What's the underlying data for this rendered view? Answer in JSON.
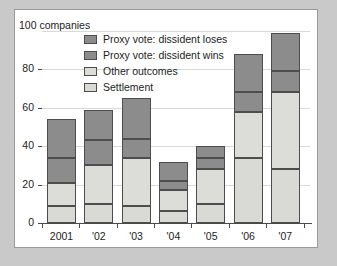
{
  "chart_data": {
    "type": "bar",
    "subtype": "stacked",
    "title": "",
    "xlabel": "",
    "ylabel": "100 companies",
    "units_label": "100 companies",
    "categories": [
      "2001",
      "'02",
      "'03",
      "'04",
      "'05",
      "'06",
      "'07"
    ],
    "ylim": [
      0,
      100
    ],
    "yticks": [
      0,
      20,
      40,
      60,
      80,
      100
    ],
    "ytick_labels": [
      "0",
      "20",
      "40",
      "60",
      "80",
      "100"
    ],
    "grid": true,
    "grid_axis": "y",
    "legend_position": "top-left-inside",
    "series": [
      {
        "name": "Settlement",
        "color": "#d9d9d6",
        "values": [
          9,
          10,
          9,
          6,
          10,
          34,
          28
        ]
      },
      {
        "name": "Other outcomes",
        "color": "#dcdcd9",
        "values": [
          12,
          20,
          25,
          11,
          18,
          24,
          40
        ]
      },
      {
        "name": "Proxy vote: dissident wins",
        "color": "#8c8c8c",
        "values": [
          13,
          13,
          10,
          5,
          6,
          10,
          11
        ]
      },
      {
        "name": "Proxy vote: dissident loses",
        "color": "#8c8c8c",
        "values": [
          20,
          16,
          21,
          10,
          6,
          20,
          20
        ]
      }
    ],
    "totals": [
      54,
      59,
      65,
      32,
      40,
      88,
      99
    ],
    "stack_boundaries": {
      "2001": [
        9,
        21,
        34,
        54
      ],
      "'02": [
        10,
        30,
        43,
        59
      ],
      "'03": [
        9,
        34,
        44,
        65
      ],
      "'04": [
        6,
        17,
        22,
        32
      ],
      "'05": [
        10,
        28,
        34,
        40
      ],
      "'06": [
        34,
        58,
        68,
        88
      ],
      "'07": [
        28,
        68,
        79,
        99
      ]
    }
  },
  "legend": {
    "items": [
      {
        "label": "Proxy vote: dissident loses",
        "color": "#8c8c8c"
      },
      {
        "label": "Proxy vote: dissident wins",
        "color": "#8c8c8c"
      },
      {
        "label": "Other outcomes",
        "color": "#dcdcd9"
      },
      {
        "label": "Settlement",
        "color": "#d9d9d6"
      }
    ]
  },
  "colors": {
    "page_background": "#c9c9c9",
    "panel_background": "#ffffff",
    "panel_border": "#9a9a9a",
    "axis": "#4a4a4a",
    "gridline": "#d9d9d9",
    "bar_outline": "#4d4d4d",
    "text": "#1d1d1d"
  }
}
